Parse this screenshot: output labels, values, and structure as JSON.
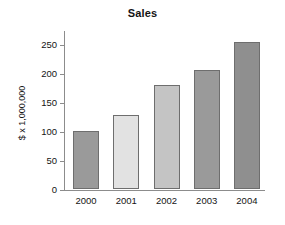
{
  "chart_data": {
    "type": "bar",
    "title": "Sales",
    "xlabel": "",
    "ylabel": "$ x 1,000,000",
    "categories": [
      "2000",
      "2001",
      "2002",
      "2003",
      "2004"
    ],
    "values": [
      100,
      128,
      180,
      205,
      255
    ],
    "series": [
      {
        "name": "Sales",
        "values": [
          100,
          128,
          180,
          205,
          255
        ]
      }
    ],
    "bar_colors": [
      "#9a9a9a",
      "#e2e2e2",
      "#c4c4c4",
      "#9a9a9a",
      "#8f8f8f"
    ],
    "bar_edge_color": "#6e6e6e",
    "ylim": [
      0,
      275
    ],
    "yticks": [
      0,
      50,
      100,
      150,
      200,
      250
    ],
    "ytick_labels": [
      "0",
      "50",
      "100",
      "150",
      "200",
      "250"
    ],
    "grid": false,
    "legend": null,
    "axis_color": "#8c8c8c",
    "background": "#ffffff"
  }
}
